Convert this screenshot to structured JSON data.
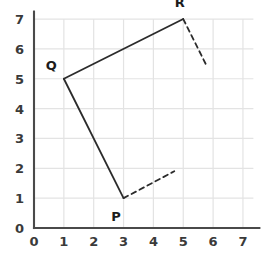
{
  "figure": {
    "title": "",
    "background_color": "#ffffff"
  },
  "chart_data": {
    "type": "scatter",
    "title": "",
    "xlabel": "",
    "ylabel": "",
    "xlim": [
      0,
      7.6
    ],
    "ylim": [
      0,
      7.6
    ],
    "xticks": [
      "0",
      "1",
      "2",
      "3",
      "4",
      "5",
      "6",
      "7"
    ],
    "yticks": [
      "0",
      "1",
      "2",
      "3",
      "4",
      "5",
      "6",
      "7"
    ],
    "grid": true,
    "grid_color": "#e3e3e3",
    "axis_color": "#4a4a4a",
    "line_color": "#2b2b2b",
    "legend": "none",
    "points": [
      {
        "label": "P",
        "x": 3,
        "y": 1,
        "label_dx": -0.25,
        "label_dy": -0.62
      },
      {
        "label": "Q",
        "x": 1,
        "y": 5,
        "label_dx": -0.42,
        "label_dy": 0.42
      },
      {
        "label": "R",
        "x": 5,
        "y": 7,
        "label_dx": -0.12,
        "label_dy": 0.55
      }
    ],
    "solid_segments": [
      {
        "name": "segment-P-Q",
        "from": [
          3,
          1
        ],
        "to": [
          1,
          5
        ]
      },
      {
        "name": "segment-Q-R",
        "from": [
          1,
          5
        ],
        "to": [
          5,
          7
        ]
      }
    ],
    "dashed_segments": [
      {
        "name": "ray-from-P",
        "from": [
          3,
          1
        ],
        "to": [
          4.7,
          1.9
        ]
      },
      {
        "name": "ray-from-R",
        "from": [
          5,
          7
        ],
        "to": [
          5.75,
          5.5
        ]
      }
    ]
  }
}
